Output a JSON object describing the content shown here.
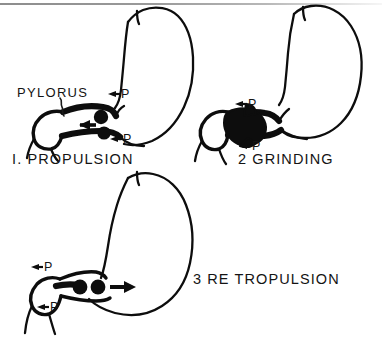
{
  "figure": {
    "background_color": "#ffffff",
    "ink_color": "#0d0d0d",
    "top_rule_color": "#9a9a9a"
  },
  "annotations": {
    "pylorus_label": "PYLORUS",
    "pressure_marker": "P"
  },
  "panels": [
    {
      "number": "I.",
      "caption": "I.  PROPULSION",
      "name": "propulsion",
      "pressure_markers": 2,
      "bolus_count": 2,
      "flow_arrow_direction": "left"
    },
    {
      "number": "2",
      "caption": "2  GRINDING",
      "name": "grinding",
      "pressure_markers": 2,
      "bolus_count": 0,
      "flow_arrow_direction": "none"
    },
    {
      "number": "3",
      "caption": "3  RE TROPULSION",
      "name": "retropulsion",
      "pressure_markers": 2,
      "bolus_count": 2,
      "flow_arrow_direction": "right"
    }
  ],
  "pressure_labels": {
    "panel1_upper": "P",
    "panel1_lower": "P",
    "panel2_upper": "P",
    "panel2_lower": "P",
    "panel3_upper": "P",
    "panel3_lower": "P"
  }
}
